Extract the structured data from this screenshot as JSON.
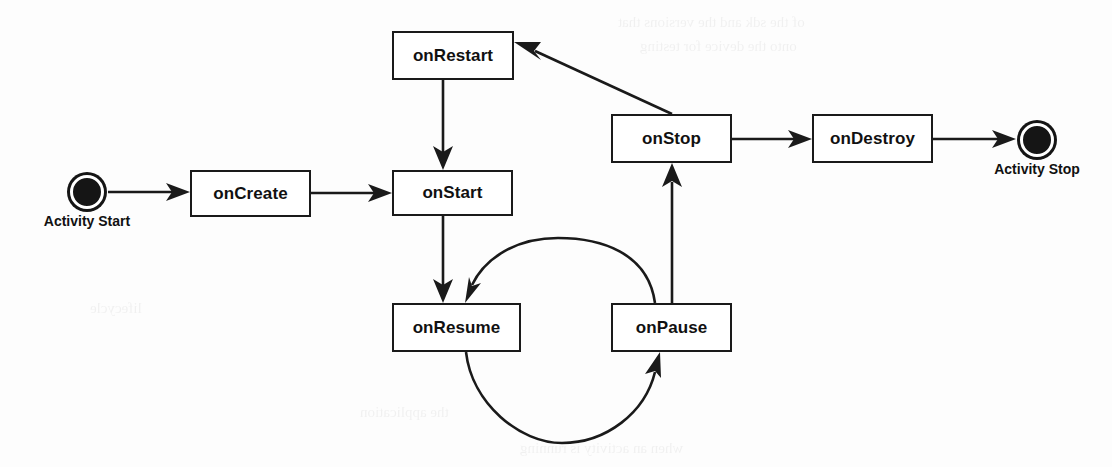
{
  "diagram": {
    "type": "state-flow-diagram",
    "background_color": "#fdfdfd",
    "line_color": "#1a1a1a",
    "node_fill": "#ffffff",
    "start_marker": {
      "name": "activity-start",
      "label": "Activity Start",
      "shape": "filled-circle-ringed",
      "cx": 87,
      "cy": 192,
      "r": 17
    },
    "end_marker": {
      "name": "activity-stop",
      "label": "Activity Stop",
      "shape": "filled-circle-ringed",
      "cx": 1037,
      "cy": 140,
      "r": 17
    },
    "nodes": [
      {
        "id": "onRestart",
        "label": "onRestart",
        "x": 392,
        "y": 31,
        "w": 122,
        "h": 49
      },
      {
        "id": "onStop",
        "label": "onStop",
        "x": 611,
        "y": 114,
        "w": 121,
        "h": 49
      },
      {
        "id": "onDestroy",
        "label": "onDestroy",
        "x": 812,
        "y": 114,
        "w": 121,
        "h": 49
      },
      {
        "id": "onCreate",
        "label": "onCreate",
        "x": 190,
        "y": 170,
        "w": 121,
        "h": 47
      },
      {
        "id": "onStart",
        "label": "onStart",
        "x": 392,
        "y": 170,
        "w": 121,
        "h": 46
      },
      {
        "id": "onResume",
        "label": "onResume",
        "x": 392,
        "y": 303,
        "w": 129,
        "h": 49
      },
      {
        "id": "onPause",
        "label": "onPause",
        "x": 611,
        "y": 303,
        "w": 121,
        "h": 49
      }
    ],
    "edges": [
      {
        "id": "start-to-oncreate",
        "from": "Activity Start",
        "to": "onCreate",
        "style": "straight"
      },
      {
        "id": "oncreate-to-onstart",
        "from": "onCreate",
        "to": "onStart",
        "style": "straight"
      },
      {
        "id": "onrestart-to-onstart",
        "from": "onRestart",
        "to": "onStart",
        "style": "straight"
      },
      {
        "id": "onstart-to-onresume",
        "from": "onStart",
        "to": "onResume",
        "style": "straight"
      },
      {
        "id": "onpause-to-onresume",
        "from": "onPause",
        "to": "onResume",
        "style": "arc-over"
      },
      {
        "id": "onresume-to-onpause",
        "from": "onResume",
        "to": "onPause",
        "style": "arc-under"
      },
      {
        "id": "onpause-to-onstop",
        "from": "onPause",
        "to": "onStop",
        "style": "straight"
      },
      {
        "id": "onstop-to-onrestart",
        "from": "onStop",
        "to": "onRestart",
        "style": "diagonal"
      },
      {
        "id": "onstop-to-ondestroy",
        "from": "onStop",
        "to": "onDestroy",
        "style": "straight"
      },
      {
        "id": "ondestroy-to-stop",
        "from": "onDestroy",
        "to": "Activity Stop",
        "style": "straight"
      }
    ]
  },
  "bleed_lines": [
    {
      "text": "of the sdk and the versions that",
      "x": 618,
      "y": 14,
      "size": 15
    },
    {
      "text": "onto the device for testing",
      "x": 640,
      "y": 38,
      "size": 15
    },
    {
      "text": "the application",
      "x": 360,
      "y": 404,
      "size": 15
    },
    {
      "text": "when an activity is running",
      "x": 520,
      "y": 440,
      "size": 15
    },
    {
      "text": "lifecycle",
      "x": 90,
      "y": 300,
      "size": 15
    }
  ]
}
